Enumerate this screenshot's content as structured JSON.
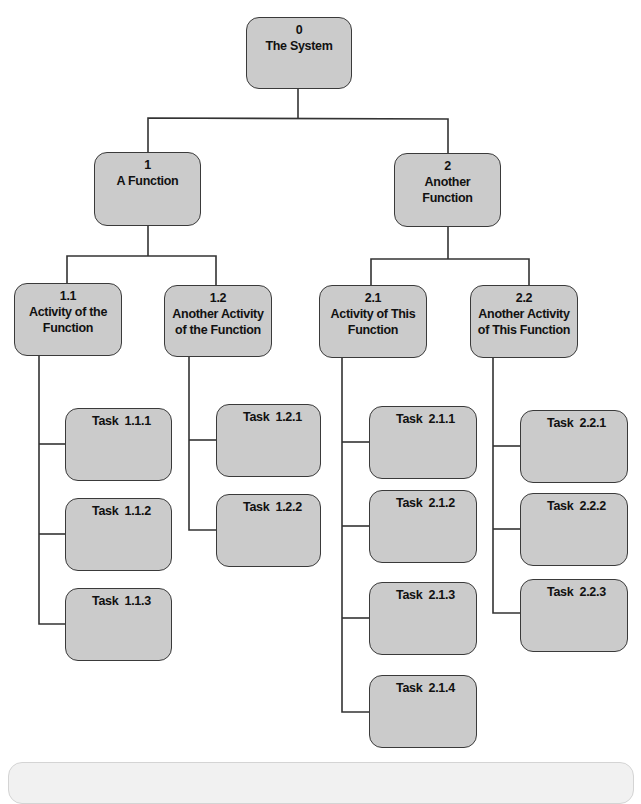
{
  "diagram": {
    "type": "work-breakdown-structure",
    "colors": {
      "box_fill": "#cbcbcb",
      "box_border": "#3a3a3a",
      "connector": "#333333",
      "text": "#111111",
      "footer_panel": "#f1f1f1"
    },
    "root": {
      "id": "0",
      "label": "The System"
    },
    "functions": [
      {
        "id": "1",
        "label_lines": [
          "A Function"
        ],
        "activities": [
          {
            "id": "1.1",
            "label_lines": [
              "Activity of the",
              "Function"
            ],
            "tasks": [
              "Task  1.1.1",
              "Task  1.1.2",
              "Task  1.1.3"
            ]
          },
          {
            "id": "1.2",
            "label_lines": [
              "Another Activity",
              "of the Function"
            ],
            "tasks": [
              "Task  1.2.1",
              "Task  1.2.2"
            ]
          }
        ]
      },
      {
        "id": "2",
        "label_lines": [
          "Another",
          "Function"
        ],
        "activities": [
          {
            "id": "2.1",
            "label_lines": [
              "Activity of This",
              "Function"
            ],
            "tasks": [
              "Task  2.1.1",
              "Task  2.1.2",
              "Task  2.1.3",
              "Task  2.1.4"
            ]
          },
          {
            "id": "2.2",
            "label_lines": [
              "Another Activity",
              "of This Function"
            ],
            "tasks": [
              "Task  2.2.1",
              "Task  2.2.2",
              "Task  2.2.3"
            ]
          }
        ]
      }
    ]
  }
}
